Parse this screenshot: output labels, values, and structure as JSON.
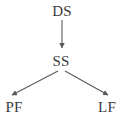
{
  "diagram": {
    "type": "tree-flowchart",
    "background_color": "#ffffff",
    "line_color": "#5a5a5a",
    "text_color": "#3b3b3b",
    "nodes": [
      {
        "id": "ds",
        "label": "DS",
        "x": 62,
        "y": 11
      },
      {
        "id": "ss",
        "label": "SS",
        "x": 61,
        "y": 61
      },
      {
        "id": "pf",
        "label": "PF",
        "x": 14,
        "y": 107
      },
      {
        "id": "lf",
        "label": "LF",
        "x": 107,
        "y": 107
      }
    ],
    "edges": [
      {
        "id": "ds-ss",
        "from": "DS",
        "to": "SS",
        "direction": "down",
        "arrowhead": true
      },
      {
        "id": "ss-pf",
        "from": "SS",
        "to": "PF",
        "direction": "down-left",
        "arrowhead": true
      },
      {
        "id": "ss-lf",
        "from": "SS",
        "to": "LF",
        "direction": "down-right",
        "arrowhead": true
      }
    ]
  }
}
